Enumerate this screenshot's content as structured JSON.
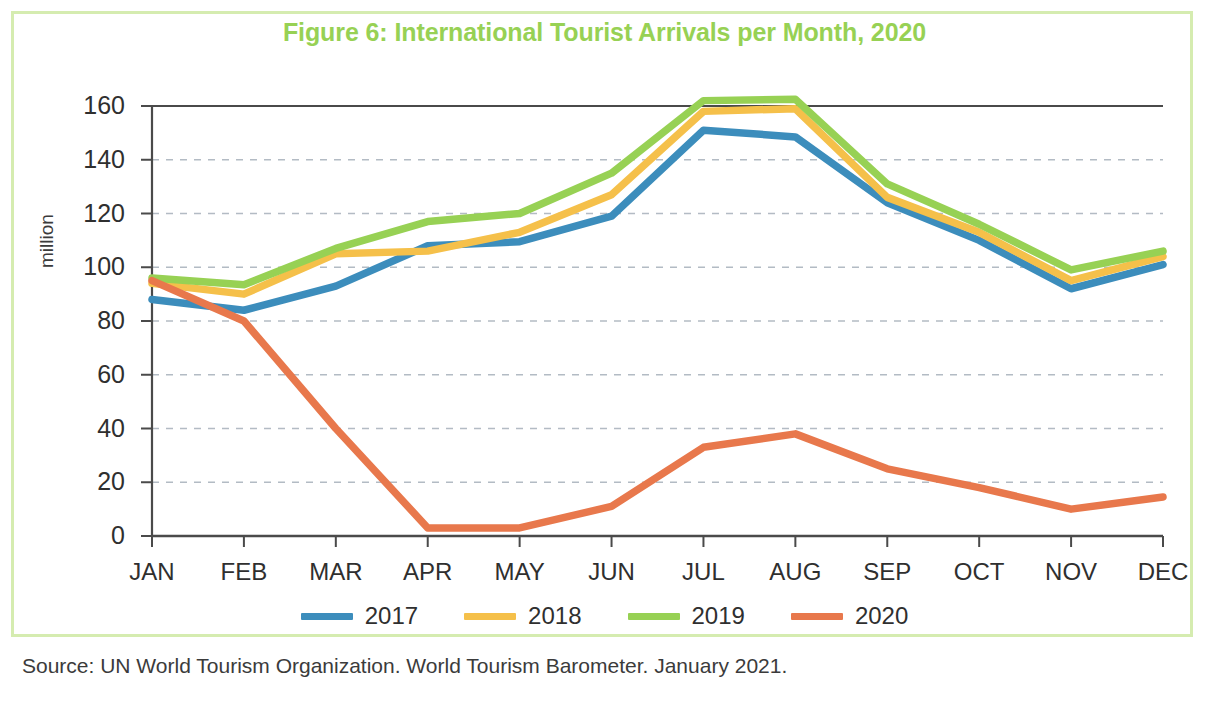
{
  "figure": {
    "title": "Figure 6: International Tourist Arrivals per Month, 2020",
    "source": "Source: UN World Tourism Organization. World Tourism Barometer. January 2021.",
    "frame_color": "#d5ecb0",
    "title_color": "#97d154"
  },
  "chart_data": {
    "type": "line",
    "title": "Figure 6: International Tourist Arrivals per Month, 2020",
    "xlabel": "",
    "ylabel": "million",
    "categories": [
      "JAN",
      "FEB",
      "MAR",
      "APR",
      "MAY",
      "JUN",
      "JUL",
      "AUG",
      "SEP",
      "OCT",
      "NOV",
      "DEC"
    ],
    "ylim": [
      0,
      160
    ],
    "yticks": [
      0,
      20,
      40,
      60,
      80,
      100,
      120,
      140,
      160
    ],
    "grid": "horizontal-dashed",
    "legend_position": "bottom-center",
    "series": [
      {
        "name": "2017",
        "color": "#3c8dbc",
        "values": [
          88,
          84,
          93,
          108,
          109.5,
          119,
          151,
          148.5,
          124,
          110,
          92,
          101
        ]
      },
      {
        "name": "2018",
        "color": "#f5c04a",
        "values": [
          94,
          90,
          105,
          106,
          113,
          127,
          158,
          159,
          126,
          113,
          95,
          104
        ]
      },
      {
        "name": "2019",
        "color": "#97d154",
        "values": [
          96,
          93.5,
          107,
          117,
          120,
          135,
          162,
          162.5,
          131,
          116,
          99,
          106
        ]
      },
      {
        "name": "2020",
        "color": "#e8784c",
        "values": [
          95,
          80,
          40,
          3,
          3,
          11,
          33,
          38,
          25,
          18,
          10,
          14.5
        ]
      }
    ]
  },
  "legend": {
    "items": [
      {
        "label": "2017",
        "color": "#3c8dbc"
      },
      {
        "label": "2018",
        "color": "#f5c04a"
      },
      {
        "label": "2019",
        "color": "#97d154"
      },
      {
        "label": "2020",
        "color": "#e8784c"
      }
    ]
  }
}
